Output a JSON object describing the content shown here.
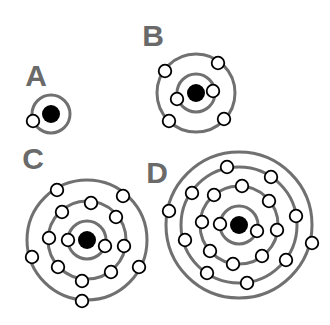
{
  "diagram": {
    "type": "bohr-atomic-models",
    "colors": {
      "background": "#ffffff",
      "label": "#6a6a6a",
      "ring": "#707070",
      "nucleus": "#000000",
      "electron_fill": "#ffffff",
      "electron_stroke": "#000000"
    },
    "atoms": [
      {
        "label": "A",
        "label_pos": [
          36,
          86
        ],
        "nucleus": [
          51,
          114
        ],
        "nucleus_r": 9,
        "shells": [
          19
        ],
        "electrons_per_shell": [
          1
        ],
        "electrons": [
          [
            33,
            121
          ]
        ]
      },
      {
        "label": "B",
        "label_pos": [
          153,
          46
        ],
        "nucleus": [
          196,
          93
        ],
        "nucleus_r": 9,
        "shells": [
          19,
          39
        ],
        "electrons_per_shell": [
          2,
          4
        ],
        "electrons": [
          [
            177,
            99
          ],
          [
            213,
            91
          ],
          [
            165,
            71
          ],
          [
            218,
            63
          ],
          [
            169,
            121
          ],
          [
            224,
            119
          ]
        ]
      },
      {
        "label": "C",
        "label_pos": [
          33,
          169
        ],
        "nucleus": [
          87,
          240
        ],
        "nucleus_r": 9,
        "shells": [
          19,
          39,
          60
        ],
        "electrons_per_shell": [
          2,
          8,
          5
        ],
        "electrons": [
          [
            68,
            240
          ],
          [
            105,
            246
          ],
          [
            91,
            203
          ],
          [
            62,
            212
          ],
          [
            116,
            217
          ],
          [
            49,
            238
          ],
          [
            124,
            246
          ],
          [
            58,
            267
          ],
          [
            111,
            272
          ],
          [
            82,
            281
          ],
          [
            57,
            190
          ],
          [
            123,
            196
          ],
          [
            32,
            257
          ],
          [
            139,
            267
          ],
          [
            82,
            301
          ]
        ]
      },
      {
        "label": "D",
        "label_pos": [
          157,
          183
        ],
        "nucleus": [
          239,
          225
        ],
        "nucleus_r": 9,
        "shells": [
          19,
          39,
          58,
          73
        ],
        "electrons_per_shell": [
          2,
          8,
          8,
          2
        ],
        "electrons": [
          [
            220,
            224
          ],
          [
            257,
            231
          ],
          [
            242,
            186
          ],
          [
            214,
            195
          ],
          [
            269,
            201
          ],
          [
            202,
            222
          ],
          [
            277,
            230
          ],
          [
            210,
            251
          ],
          [
            233,
            264
          ],
          [
            262,
            256
          ],
          [
            227,
            167
          ],
          [
            192,
            193
          ],
          [
            271,
            177
          ],
          [
            296,
            216
          ],
          [
            185,
            240
          ],
          [
            286,
            260
          ],
          [
            207,
            273
          ],
          [
            247,
            283
          ],
          [
            169,
            211
          ],
          [
            312,
            243
          ]
        ]
      }
    ]
  }
}
